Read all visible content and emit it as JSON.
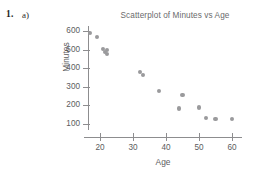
{
  "exercise": {
    "number": "1.",
    "part": "a)"
  },
  "chart_data": {
    "type": "scatter",
    "title": "Scatterplot of Minutes vs Age",
    "xlabel": "Age",
    "ylabel": "Minutes",
    "xlim": [
      15,
      63
    ],
    "ylim": [
      85,
      620
    ],
    "xticks": [
      20,
      30,
      40,
      50,
      60
    ],
    "yticks": [
      100,
      200,
      300,
      400,
      500,
      600
    ],
    "grid": false,
    "legend": "none",
    "marker_color": "#9a9a9c",
    "axis_color": "#8d8d8f",
    "points": [
      {
        "x": 17,
        "y": 588
      },
      {
        "x": 19,
        "y": 568
      },
      {
        "x": 21,
        "y": 503
      },
      {
        "x": 21.5,
        "y": 487
      },
      {
        "x": 22,
        "y": 496
      },
      {
        "x": 22,
        "y": 477
      },
      {
        "x": 32,
        "y": 381
      },
      {
        "x": 33,
        "y": 362
      },
      {
        "x": 38,
        "y": 277
      },
      {
        "x": 45,
        "y": 254
      },
      {
        "x": 44,
        "y": 183
      },
      {
        "x": 50,
        "y": 189
      },
      {
        "x": 52,
        "y": 133
      },
      {
        "x": 55,
        "y": 126
      },
      {
        "x": 60,
        "y": 126
      }
    ]
  }
}
